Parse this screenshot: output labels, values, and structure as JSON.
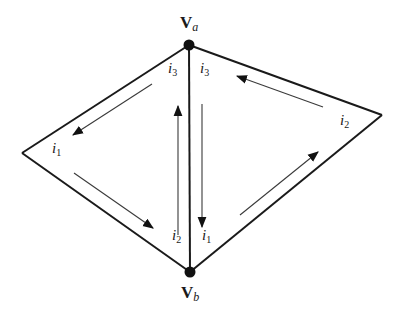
{
  "diagram": {
    "colors": {
      "edge": "#1a1a1a",
      "arrow": "#3a3a3a",
      "node": "#111111",
      "background": "#ffffff"
    },
    "vertices": {
      "va": {
        "main": "V",
        "sub": "a",
        "x": 189,
        "y": 45
      },
      "vb": {
        "main": "V",
        "sub": "b",
        "x": 190,
        "y": 272
      },
      "left": {
        "x": 22,
        "y": 153
      },
      "right": {
        "x": 382,
        "y": 115
      }
    },
    "left_triangle": {
      "labels": {
        "top_corner": {
          "main": "i",
          "sub": "3"
        },
        "left_corner": {
          "main": "i",
          "sub": "1"
        },
        "bottom_corner": {
          "main": "i",
          "sub": "2"
        }
      },
      "arrows": [
        "i3 to i1 (down-left along upper edge)",
        "i1 to i2 (down-right along lower edge)",
        "i2 to i3 (upward along shared edge)"
      ]
    },
    "right_triangle": {
      "labels": {
        "top_corner": {
          "main": "i",
          "sub": "3"
        },
        "right_corner": {
          "main": "i",
          "sub": "2"
        },
        "bottom_corner": {
          "main": "i",
          "sub": "1"
        }
      },
      "arrows": [
        "i3 to i1 (downward along shared edge)",
        "i1 to i2 (up-right along lower edge)",
        "i2 to i3 (up-left along upper edge)"
      ]
    }
  }
}
